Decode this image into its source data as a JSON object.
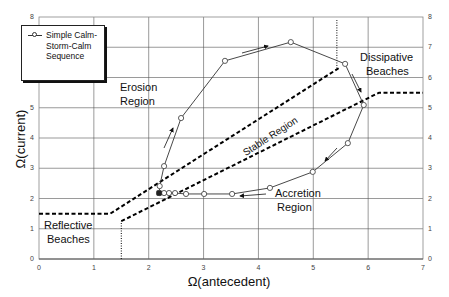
{
  "chart_data": {
    "type": "line",
    "title": "",
    "xlabel": "Ω(antecedent)",
    "ylabel": "Ω(current)",
    "xlim": [
      0,
      7
    ],
    "ylim": [
      0,
      8
    ],
    "x_ticks": [
      "0",
      "1",
      "2",
      "3",
      "4",
      "5",
      "6",
      "7"
    ],
    "y_ticks": [
      "0",
      "1",
      "2",
      "3",
      "4",
      "5",
      "6",
      "7",
      "8"
    ],
    "y_ticks_right": [
      "0",
      "1",
      "2",
      "3",
      "4",
      "5",
      "6",
      "7",
      "8"
    ],
    "grid": true,
    "legend_position": "upper-left",
    "series": [
      {
        "name": "Simple Calm-Storm-Calm Sequence",
        "marker": "open-circle",
        "x": [
          2.19,
          2.2,
          2.28,
          2.59,
          3.39,
          4.59,
          5.58,
          5.92,
          5.63,
          4.99,
          4.21,
          3.52,
          3.01,
          2.68,
          2.48,
          2.37,
          2.28,
          2.19
        ],
        "y": [
          2.18,
          2.41,
          3.07,
          4.66,
          6.55,
          7.17,
          6.45,
          5.09,
          3.83,
          2.88,
          2.35,
          2.15,
          2.15,
          2.15,
          2.18,
          2.18,
          2.18,
          2.18
        ]
      }
    ],
    "boundaries": [
      {
        "name": "upper-boundary",
        "style": "dashed",
        "x": [
          0,
          1.3,
          5.5
        ],
        "y": [
          1.5,
          1.5,
          6.35
        ]
      },
      {
        "name": "lower-boundary",
        "style": "dashed",
        "x": [
          1.5,
          6.2,
          7.0
        ],
        "y": [
          1.25,
          5.5,
          5.5
        ]
      },
      {
        "name": "reflective-limit",
        "style": "dotted",
        "x": [
          1.5,
          1.5
        ],
        "y": [
          0,
          1.25
        ]
      },
      {
        "name": "dissipative-limit",
        "style": "dotted",
        "x": [
          5.43,
          5.43
        ],
        "y": [
          6.3,
          7.9
        ]
      }
    ],
    "annotations": [
      {
        "text": "Erosion Region",
        "x": 2.0,
        "y": 5.6
      },
      {
        "text": "Stable Region",
        "x": 3.6,
        "y": 3.6,
        "rotation": -33
      },
      {
        "text": "Accretion Region",
        "x": 4.4,
        "y": 1.9
      },
      {
        "text": "Dissipative Beaches",
        "x": 6.1,
        "y": 6.6
      },
      {
        "text": "Reflective Beaches",
        "x": 0.4,
        "y": 0.9
      }
    ]
  },
  "axes": {
    "xlabel": "Ω(antecedent)",
    "ylabel": "Ω(current)",
    "x_ticks": [
      "0",
      "1",
      "2",
      "3",
      "4",
      "5",
      "6",
      "7"
    ],
    "y_ticks": [
      "0",
      "1",
      "2",
      "3",
      "4",
      "5",
      "6",
      "7",
      "8"
    ]
  },
  "legend": {
    "label": "Simple Calm-Storm-Calm Sequence"
  },
  "regions": {
    "erosion_1": "Erosion",
    "erosion_2": "Region",
    "stable": "Stable Region",
    "accretion_1": "Accretion",
    "accretion_2": "Region",
    "dissipative_1": "Dissipative",
    "dissipative_2": "Beaches",
    "reflective_1": "Reflective",
    "reflective_2": "Beaches"
  },
  "colors": {
    "line": "#333333",
    "grid": "#555555",
    "dashed": "#000000"
  }
}
